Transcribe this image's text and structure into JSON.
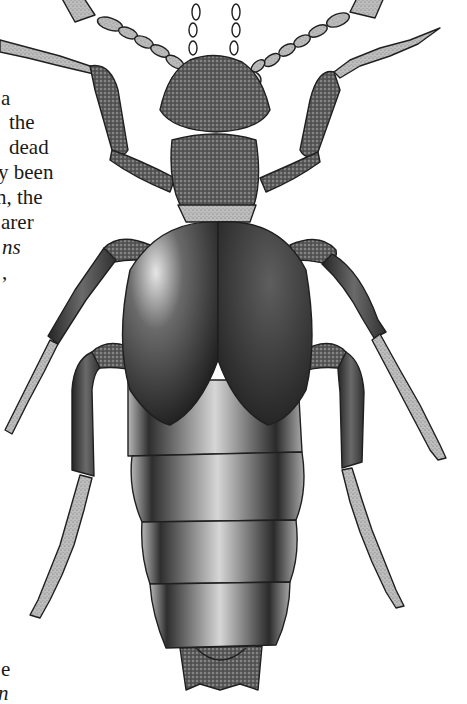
{
  "page": {
    "type": "book page excerpt",
    "colors": {
      "background": "#ffffff",
      "text": "#1a1a1a",
      "ink": "#1f1f1f"
    }
  },
  "text_fragments": [
    {
      "text": "a",
      "x": 1,
      "y": 87,
      "italic": false
    },
    {
      "text": "the",
      "x": 9,
      "y": 111,
      "italic": false
    },
    {
      "text": "dead",
      "x": 9,
      "y": 136,
      "italic": false
    },
    {
      "text": "y been",
      "x": -2,
      "y": 161,
      "italic": false
    },
    {
      "text": "n, the",
      "x": -4,
      "y": 186,
      "italic": false
    },
    {
      "text": "arer",
      "x": 1,
      "y": 211,
      "italic": false
    },
    {
      "text": "ns",
      "x": 2,
      "y": 236,
      "italic": true
    },
    {
      "text": ",",
      "x": 2,
      "y": 261,
      "italic": false
    },
    {
      "text": "e",
      "x": 1,
      "y": 658,
      "italic": false
    },
    {
      "text": "n",
      "x": -2,
      "y": 682,
      "italic": true
    }
  ],
  "illustration": {
    "subject": "rove beetle (Staphylinidae), dorsal view",
    "style": "stippled black-and-white scientific illustration",
    "parts": [
      "antennae",
      "head",
      "pronotum",
      "elytra",
      "abdominal segments",
      "forelegs",
      "midlegs",
      "hindlegs"
    ]
  }
}
